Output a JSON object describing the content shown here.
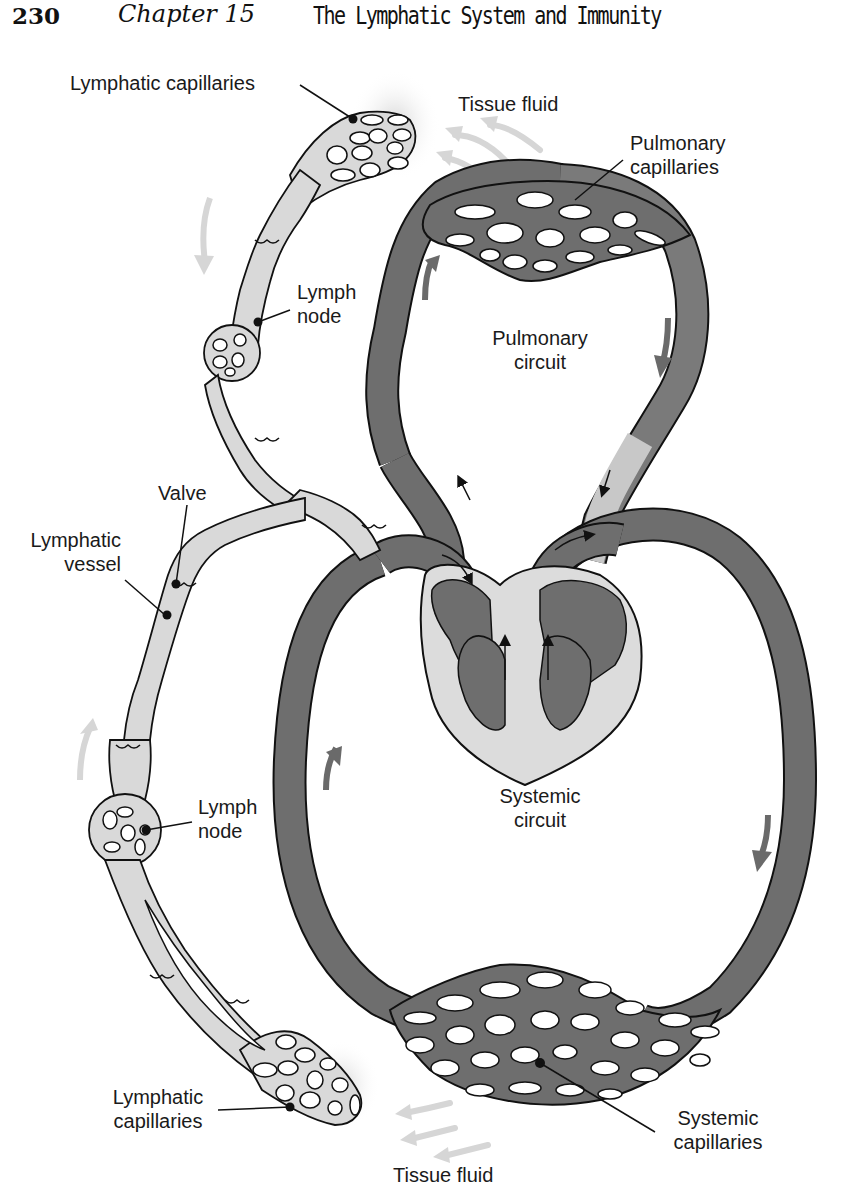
{
  "header": {
    "page_number": "230",
    "chapter": "Chapter 15",
    "chapter_title": "The Lymphatic System and Immunity"
  },
  "figure": {
    "labels": {
      "lymphatic_capillaries_top": "Lymphatic capillaries",
      "tissue_fluid_top": "Tissue fluid",
      "pulmonary_capillaries_line1": "Pulmonary",
      "pulmonary_capillaries_line2": "capillaries",
      "lymph_node_top_line1": "Lymph",
      "lymph_node_top_line2": "node",
      "pulmonary_circuit_line1": "Pulmonary",
      "pulmonary_circuit_line2": "circuit",
      "valve": "Valve",
      "lymphatic_vessel_line1": "Lymphatic",
      "lymphatic_vessel_line2": "vessel",
      "lymph_node_bottom_line1": "Lymph",
      "lymph_node_bottom_line2": "node",
      "systemic_circuit_line1": "Systemic",
      "systemic_circuit_line2": "circuit",
      "lymphatic_capillaries_bottom_line1": "Lymphatic",
      "lymphatic_capillaries_bottom_line2": "capillaries",
      "systemic_capillaries_line1": "Systemic",
      "systemic_capillaries_line2": "capillaries",
      "tissue_fluid_bottom": "Tissue fluid"
    },
    "colors": {
      "blood_vessel": "#6e6e6e",
      "lymph_vessel": "#d9d9d9",
      "heart_wall": "#dcdcdc",
      "flow_arrow_blood": "#6a6a6a",
      "flow_arrow_lymph": "#d4d4d4",
      "outline": "#111111"
    }
  }
}
